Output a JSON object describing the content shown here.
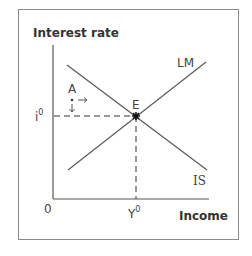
{
  "diagram": {
    "type": "IS-LM",
    "axes": {
      "y_label": "Interest rate",
      "x_label": "Income",
      "origin_label": "0"
    },
    "curves": [
      {
        "name": "LM",
        "label": "LM",
        "slope": "upward"
      },
      {
        "name": "IS",
        "label": "IS",
        "slope": "downward"
      }
    ],
    "points": {
      "equilibrium": {
        "label": "E"
      },
      "disequilibrium": {
        "label": "A",
        "arrows": [
          "→",
          "↓"
        ],
        "marker": "*"
      }
    },
    "equilibrium_values": {
      "interest_rate_label": "i",
      "interest_rate_sup": "0",
      "income_label": "Y",
      "income_sup": "0"
    }
  }
}
